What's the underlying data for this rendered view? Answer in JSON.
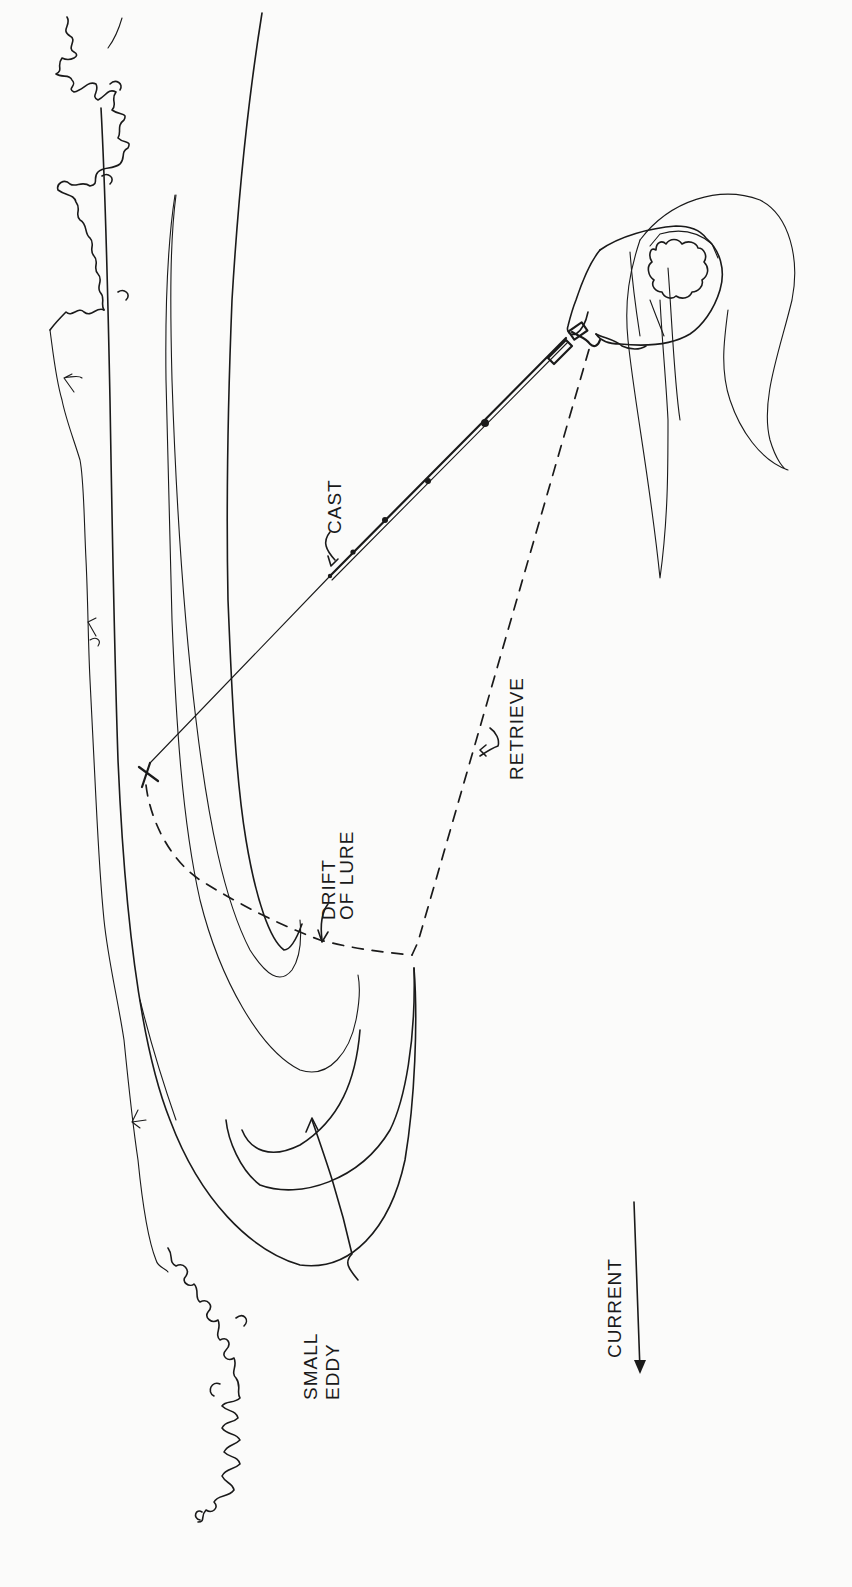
{
  "diagram": {
    "type": "fishing-technique-illustration",
    "ink_color": "#1a1a1a",
    "background_color": "#fbfbfa",
    "orientation": "rotated 90deg (text reads bottom-to-top)"
  },
  "labels": {
    "cast": "CAST",
    "drift_line1": "DRIFT",
    "drift_line2": "OF LURE",
    "retrieve": "RETRIEVE",
    "eddy_line1": "SMALL",
    "eddy_line2": "EDDY",
    "current": "CURRENT"
  },
  "elements": {
    "shoreline": "riverbank with vegetation (bushes) along left edge",
    "angler": "angler viewed from above holding spinning rod",
    "cast_line": "line from rod tip to lure landing point (X)",
    "lure_landing": "X",
    "drift_path": "dashed curve from X downstream into eddy",
    "retrieve_path": "dashed line from end of drift back to angler",
    "eddy": "nested curved current lines forming small eddy",
    "current_arrow": "arrow pointing downstream"
  }
}
